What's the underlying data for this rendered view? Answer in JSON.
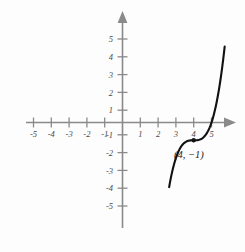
{
  "chart_data": {
    "type": "line",
    "title": "",
    "subtitle": "",
    "xlabel": "",
    "ylabel": "",
    "xlim": [
      -6.2,
      6.0
    ],
    "ylim": [
      -6.6,
      6.3
    ],
    "grid": false,
    "legend": null,
    "x_ticks": [
      -5,
      -4,
      -3,
      -2,
      -1,
      1,
      2,
      3,
      4,
      5
    ],
    "y_ticks": [
      -5,
      -4,
      -3,
      -2,
      -1,
      1,
      2,
      3,
      4,
      5
    ],
    "x_tick_labels": [
      "-5",
      "-4",
      "-3",
      "-2",
      "-1",
      "1",
      "2",
      "3",
      "4",
      "5"
    ],
    "y_tick_labels": [
      "-5",
      "-4",
      "-3",
      "-2",
      "-1",
      "1",
      "2",
      "3",
      "4",
      "5"
    ],
    "annotations": [
      {
        "label": "(4, −1)",
        "x": 4,
        "y": -1,
        "marker": "dot"
      }
    ],
    "series": [
      {
        "name": "cubic",
        "equation": "y = (x - 4)^3 - 1",
        "points": [
          {
            "x": 3.0,
            "y": -2.0
          },
          {
            "x": 3.1,
            "y": -1.729
          },
          {
            "x": 3.2,
            "y": -1.512
          },
          {
            "x": 3.3,
            "y": -1.343
          },
          {
            "x": 3.4,
            "y": -1.216
          },
          {
            "x": 3.5,
            "y": -1.125
          },
          {
            "x": 3.6,
            "y": -1.064
          },
          {
            "x": 3.7,
            "y": -1.027
          },
          {
            "x": 3.8,
            "y": -1.008
          },
          {
            "x": 3.9,
            "y": -1.001
          },
          {
            "x": 4.0,
            "y": -1.0
          },
          {
            "x": 4.1,
            "y": -0.999
          },
          {
            "x": 4.2,
            "y": -0.992
          },
          {
            "x": 4.3,
            "y": -0.973
          },
          {
            "x": 4.4,
            "y": -0.936
          },
          {
            "x": 4.5,
            "y": -0.875
          },
          {
            "x": 4.6,
            "y": -0.784
          },
          {
            "x": 4.7,
            "y": -0.657
          },
          {
            "x": 4.8,
            "y": -0.488
          },
          {
            "x": 4.9,
            "y": -0.271
          },
          {
            "x": 5.0,
            "y": 0.0
          },
          {
            "x": 5.2,
            "y": 0.728
          },
          {
            "x": 5.4,
            "y": 1.744
          },
          {
            "x": 5.6,
            "y": 3.096
          },
          {
            "x": 5.75,
            "y": 4.372
          }
        ],
        "color": "#111111"
      }
    ]
  },
  "axes": {
    "x_axis_name": "x-axis",
    "y_axis_name": "y-axis",
    "origin_label": "",
    "arrow_ends": [
      "right",
      "up"
    ]
  },
  "colors": {
    "axis": "#8a8a8a",
    "curve": "#111111",
    "tick_text": "#4a4a4a",
    "annotation_text": "#1a1a1a",
    "background": "#fdfdfd"
  }
}
